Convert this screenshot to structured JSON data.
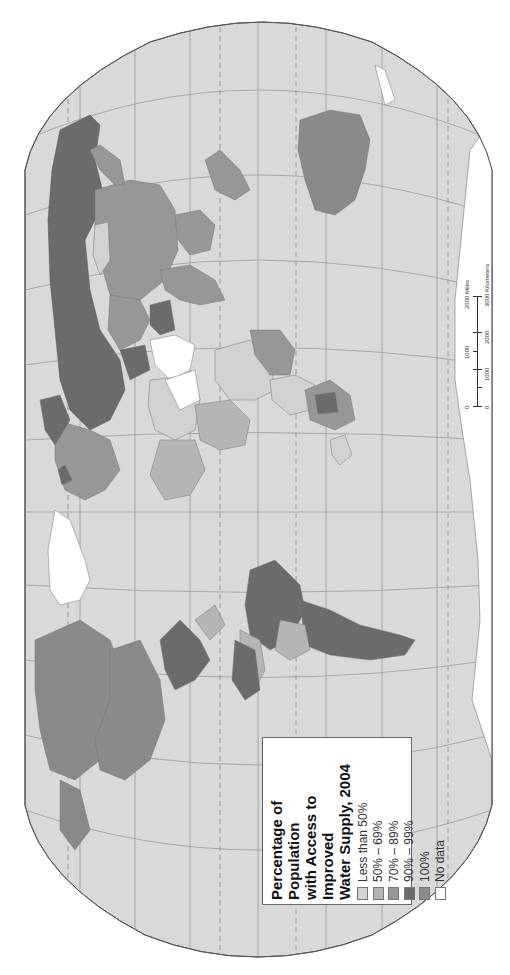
{
  "map": {
    "title": "Percentage of Population with Access to Improved Water Supply, 2004",
    "orientation": "rotated 90 degrees counter-clockwise (north points left)",
    "colors": {
      "ocean": "#d9d9d9",
      "graticule": "#9a9a9a",
      "less_than_50": "#d2d2d2",
      "50_69": "#b5b5b5",
      "70_89": "#979797",
      "90_99": "#6b6b6b",
      "100": "#8a8a8a",
      "no_data": "#ffffff"
    }
  },
  "legend": {
    "title_line1": "Percentage of Population",
    "title_line2": "with Access to Improved",
    "title_line3": "Water Supply, 2004",
    "items": [
      {
        "label": "Less than 50%",
        "color": "#d2d2d2"
      },
      {
        "label": "50% – 69%",
        "color": "#b5b5b5"
      },
      {
        "label": "70% – 89%",
        "color": "#979797"
      },
      {
        "label": "90% – 99%",
        "color": "#6b6b6b"
      },
      {
        "label": "100%",
        "color": "#8a8a8a"
      },
      {
        "label": "No data",
        "color": "#ffffff"
      }
    ]
  },
  "scale": {
    "miles_label": "2000 Miles",
    "miles_ticks": [
      "0",
      "1000",
      "2000 Miles"
    ],
    "km_ticks": [
      "0",
      "1000",
      "2000",
      "3000 Kilometers"
    ]
  }
}
